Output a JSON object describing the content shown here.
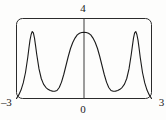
{
  "chart_data": {
    "type": "line",
    "title": "",
    "subtitle": "",
    "xlabel": "",
    "ylabel": "",
    "xlim": [
      -3,
      3
    ],
    "ylim": [
      0,
      4
    ],
    "grid": false,
    "legend": null,
    "frame": "box",
    "axis_lines": [
      "vertical-at-x-0"
    ],
    "tick_labels": {
      "x_min": "–3",
      "x_zero": "0",
      "x_max": "3",
      "y_max": "4"
    },
    "line_color": "#1a1a1a",
    "line_width": 1.1,
    "series": [
      {
        "name": "f(x)",
        "x": [
          -3.0,
          -2.9,
          -2.8,
          -2.7,
          -2.6,
          -2.5,
          -2.45,
          -2.4,
          -2.35,
          -2.3,
          -2.25,
          -2.2,
          -2.15,
          -2.1,
          -2.0,
          -1.9,
          -1.8,
          -1.7,
          -1.6,
          -1.5,
          -1.4,
          -1.3,
          -1.2,
          -1.1,
          -1.0,
          -0.9,
          -0.8,
          -0.7,
          -0.6,
          -0.5,
          -0.4,
          -0.3,
          -0.2,
          -0.1,
          0.0,
          0.1,
          0.2,
          0.3,
          0.4,
          0.5,
          0.6,
          0.7,
          0.8,
          0.9,
          1.0,
          1.1,
          1.2,
          1.3,
          1.4,
          1.5,
          1.6,
          1.7,
          1.8,
          1.9,
          2.0,
          2.1,
          2.15,
          2.2,
          2.25,
          2.3,
          2.35,
          2.4,
          2.45,
          2.5,
          2.6,
          2.7,
          2.8,
          2.9,
          3.0
        ],
        "y": [
          0.0,
          0.18,
          0.42,
          0.78,
          1.3,
          2.05,
          2.5,
          2.92,
          3.2,
          3.35,
          3.28,
          3.02,
          2.62,
          2.2,
          1.48,
          1.0,
          0.72,
          0.56,
          0.46,
          0.4,
          0.37,
          0.36,
          0.4,
          0.55,
          0.82,
          1.2,
          1.65,
          2.1,
          2.5,
          2.8,
          3.02,
          3.18,
          3.26,
          3.3,
          3.31,
          3.3,
          3.26,
          3.18,
          3.02,
          2.8,
          2.5,
          2.1,
          1.65,
          1.2,
          0.82,
          0.55,
          0.4,
          0.36,
          0.37,
          0.4,
          0.46,
          0.56,
          0.72,
          1.0,
          1.48,
          2.2,
          2.62,
          3.02,
          3.28,
          3.35,
          3.2,
          2.92,
          2.5,
          2.05,
          1.3,
          0.78,
          0.42,
          0.18,
          0.0
        ]
      }
    ],
    "annotations": [
      {
        "name": "left-peak",
        "x": -2.3,
        "y": 3.35
      },
      {
        "name": "right-peak",
        "x": 2.3,
        "y": 3.35
      },
      {
        "name": "center-plateau",
        "x": 0.0,
        "y": 3.31
      },
      {
        "name": "left-valley",
        "x": -1.3,
        "y": 0.36
      },
      {
        "name": "right-valley",
        "x": 1.3,
        "y": 0.36
      }
    ]
  }
}
